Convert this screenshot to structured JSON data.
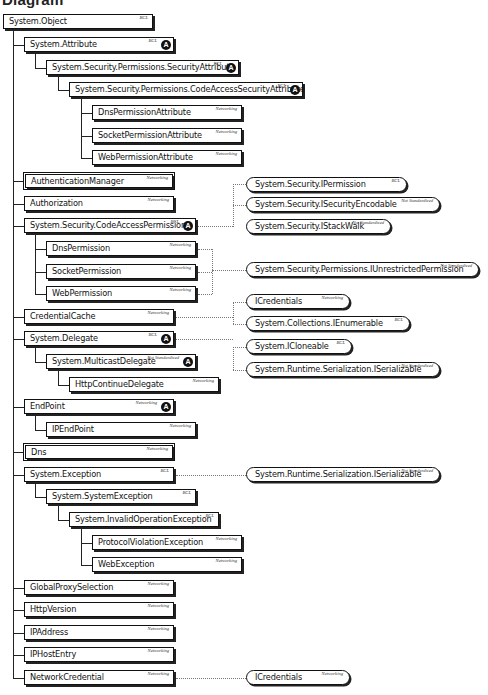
{
  "title": "Diagram",
  "classes": [
    {
      "name": "System.Object",
      "tag": "BCL",
      "abstract": false,
      "sealed": false,
      "x": 3,
      "y": 14,
      "w": 150
    },
    {
      "name": "System.Attribute",
      "tag": "BCL",
      "abstract": true,
      "sealed": false,
      "x": 24,
      "y": 37,
      "w": 150
    },
    {
      "name": "System.Security.Permissions.SecurityAttribute",
      "tag": "BCL",
      "abstract": true,
      "sealed": false,
      "x": 46,
      "y": 60,
      "w": 193
    },
    {
      "name": "System.Security.Permissions.CodeAccessSecurityAttribute",
      "tag": "BCL",
      "abstract": true,
      "sealed": false,
      "x": 69,
      "y": 82,
      "w": 234
    },
    {
      "name": "DnsPermissionAttribute",
      "tag": "Networking",
      "abstract": false,
      "sealed": false,
      "x": 92,
      "y": 105,
      "w": 150
    },
    {
      "name": "SocketPermissionAttribute",
      "tag": "Networking",
      "abstract": false,
      "sealed": false,
      "x": 92,
      "y": 128,
      "w": 150
    },
    {
      "name": "WebPermissionAttribute",
      "tag": "Networking",
      "abstract": false,
      "sealed": false,
      "x": 92,
      "y": 150,
      "w": 150
    },
    {
      "name": "AuthenticationManager",
      "tag": "Networking",
      "abstract": false,
      "sealed": true,
      "x": 24,
      "y": 173,
      "w": 150
    },
    {
      "name": "Authorization",
      "tag": "Networking",
      "abstract": false,
      "sealed": false,
      "x": 24,
      "y": 196,
      "w": 150
    },
    {
      "name": "System.Security.CodeAccessPermission",
      "tag": "BCL",
      "abstract": true,
      "sealed": false,
      "x": 24,
      "y": 218,
      "w": 172
    },
    {
      "name": "DnsPermission",
      "tag": "Networking",
      "abstract": false,
      "sealed": false,
      "x": 46,
      "y": 241,
      "w": 150
    },
    {
      "name": "SocketPermission",
      "tag": "Networking",
      "abstract": false,
      "sealed": false,
      "x": 46,
      "y": 264,
      "w": 150
    },
    {
      "name": "WebPermission",
      "tag": "Networking",
      "abstract": false,
      "sealed": false,
      "x": 46,
      "y": 286,
      "w": 150
    },
    {
      "name": "CredentialCache",
      "tag": "Networking",
      "abstract": false,
      "sealed": false,
      "x": 24,
      "y": 309,
      "w": 150
    },
    {
      "name": "System.Delegate",
      "tag": "BCL",
      "abstract": true,
      "sealed": false,
      "x": 24,
      "y": 331,
      "w": 150
    },
    {
      "name": "System.MulticastDelegate",
      "tag": "Not Standardized",
      "abstract": true,
      "sealed": false,
      "x": 46,
      "y": 354,
      "w": 150
    },
    {
      "name": "HttpContinueDelegate",
      "tag": "Networking",
      "abstract": false,
      "sealed": false,
      "x": 69,
      "y": 377,
      "w": 150
    },
    {
      "name": "EndPoint",
      "tag": "Networking",
      "abstract": true,
      "sealed": false,
      "x": 24,
      "y": 399,
      "w": 150
    },
    {
      "name": "IPEndPoint",
      "tag": "Networking",
      "abstract": false,
      "sealed": false,
      "x": 46,
      "y": 422,
      "w": 150
    },
    {
      "name": "Dns",
      "tag": "Networking",
      "abstract": false,
      "sealed": true,
      "x": 24,
      "y": 444,
      "w": 150
    },
    {
      "name": "System.Exception",
      "tag": "BCL",
      "abstract": false,
      "sealed": false,
      "x": 24,
      "y": 467,
      "w": 150
    },
    {
      "name": "System.SystemException",
      "tag": "BCL",
      "abstract": false,
      "sealed": false,
      "x": 46,
      "y": 489,
      "w": 150
    },
    {
      "name": "System.InvalidOperationException",
      "tag": "BCL",
      "abstract": false,
      "sealed": false,
      "x": 69,
      "y": 512,
      "w": 150
    },
    {
      "name": "ProtocolViolationException",
      "tag": "Networking",
      "abstract": false,
      "sealed": false,
      "x": 92,
      "y": 535,
      "w": 150
    },
    {
      "name": "WebException",
      "tag": "Networking",
      "abstract": false,
      "sealed": false,
      "x": 92,
      "y": 557,
      "w": 150
    },
    {
      "name": "GlobalProxySelection",
      "tag": "Networking",
      "abstract": false,
      "sealed": false,
      "x": 24,
      "y": 580,
      "w": 150
    },
    {
      "name": "HttpVersion",
      "tag": "Networking",
      "abstract": false,
      "sealed": false,
      "x": 24,
      "y": 602,
      "w": 150
    },
    {
      "name": "IPAddress",
      "tag": "Networking",
      "abstract": false,
      "sealed": false,
      "x": 24,
      "y": 625,
      "w": 150
    },
    {
      "name": "IPHostEntry",
      "tag": "Networking",
      "abstract": false,
      "sealed": false,
      "x": 24,
      "y": 647,
      "w": 150
    },
    {
      "name": "NetworkCredential",
      "tag": "Networking",
      "abstract": false,
      "sealed": false,
      "x": 24,
      "y": 670,
      "w": 150
    }
  ],
  "interfaces": [
    {
      "name": "System.Security.IPermission",
      "tag": "BCL",
      "x": 246,
      "y": 177,
      "w": 161
    },
    {
      "name": "System.Security.ISecurityEncodable",
      "tag": "Not Standardized",
      "x": 246,
      "y": 197,
      "w": 194
    },
    {
      "name": "System.Security.IStackWalk",
      "tag": "Not Standardized",
      "x": 246,
      "y": 219,
      "w": 145
    },
    {
      "name": "System.Security.Permissions.IUnrestrictedPermission",
      "tag": "Not Standardized",
      "x": 246,
      "y": 262,
      "w": 233
    },
    {
      "name": "ICredentials",
      "tag": "Networking",
      "x": 246,
      "y": 294,
      "w": 104
    },
    {
      "name": "System.Collections.IEnumerable",
      "tag": "BCL",
      "x": 246,
      "y": 316,
      "w": 164
    },
    {
      "name": "System.ICloneable",
      "tag": "BCL",
      "x": 246,
      "y": 339,
      "w": 106
    },
    {
      "name": "System.Runtime.Serialization.ISerializable",
      "tag": "Not Standardized",
      "x": 246,
      "y": 362,
      "w": 194
    },
    {
      "name": "System.Runtime.Serialization.ISerializable",
      "tag": "Not Standardized",
      "x": 246,
      "y": 467,
      "w": 194
    },
    {
      "name": "ICredentials",
      "tag": "Networking",
      "x": 246,
      "y": 670,
      "w": 104
    }
  ],
  "abstract_badge": "A"
}
